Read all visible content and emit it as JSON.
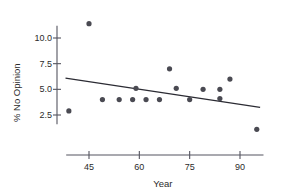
{
  "chart_data": {
    "type": "scatter",
    "title": "",
    "xlabel": "Year",
    "ylabel": "% No Opinion",
    "xlim": [
      38,
      97
    ],
    "ylim": [
      0.4,
      11.6
    ],
    "xticks": [
      45,
      60,
      75,
      90
    ],
    "xtick_labels": [
      "45",
      "60",
      "75",
      "90"
    ],
    "yticks": [
      2.5,
      5.0,
      7.5,
      10.0
    ],
    "ytick_labels": [
      "2.5",
      "5.0",
      "7.5",
      "10.0"
    ],
    "grid": false,
    "legend": null,
    "point_color": "#4a4a52",
    "line_color": "#2b2b33",
    "axis_color": "#555560",
    "points": [
      {
        "x": 39,
        "y": 2.9
      },
      {
        "x": 45,
        "y": 11.4
      },
      {
        "x": 49,
        "y": 4.0
      },
      {
        "x": 54,
        "y": 4.0
      },
      {
        "x": 58,
        "y": 4.0
      },
      {
        "x": 59,
        "y": 5.1
      },
      {
        "x": 62,
        "y": 4.0
      },
      {
        "x": 66,
        "y": 4.0
      },
      {
        "x": 69,
        "y": 7.0
      },
      {
        "x": 71,
        "y": 5.1
      },
      {
        "x": 75,
        "y": 4.0
      },
      {
        "x": 79,
        "y": 5.0
      },
      {
        "x": 84,
        "y": 4.1
      },
      {
        "x": 84,
        "y": 5.0
      },
      {
        "x": 87,
        "y": 6.0
      },
      {
        "x": 95,
        "y": 1.1
      }
    ],
    "trend_line": {
      "x_start": 38,
      "y_start": 6.1,
      "x_end": 96,
      "y_end": 3.25
    }
  },
  "axes": {
    "x_axis_name": "year-axis",
    "y_axis_name": "percent-no-opinion-axis"
  }
}
